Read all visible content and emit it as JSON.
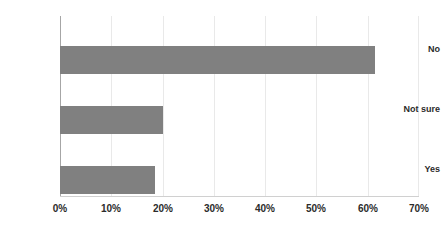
{
  "chart_data": {
    "type": "bar",
    "orientation": "horizontal",
    "title": "",
    "xlabel": "",
    "ylabel": "",
    "categories": [
      "No",
      "Not sure",
      "Yes"
    ],
    "values": [
      61.5,
      20.0,
      18.5
    ],
    "value_suffix": "%",
    "xlim": [
      0,
      70
    ],
    "xticks": [
      0,
      10,
      20,
      30,
      40,
      50,
      60,
      70
    ],
    "xtick_labels": [
      "0%",
      "10%",
      "20%",
      "30%",
      "40%",
      "50%",
      "60%",
      "70%"
    ],
    "grid": true,
    "grid_axis": "x",
    "legend": false,
    "legend_position": "none",
    "series": [
      {
        "name": "Share of respondents",
        "values": [
          61.5,
          20.0,
          18.5
        ]
      }
    ]
  },
  "style": {
    "bar_color": "#808080",
    "gridline_color": "#e9e9e9",
    "axis_color": "#a6a6a6",
    "baseline_color": "#d0d0d0",
    "label_color": "#2b2b2b",
    "background": "#ffffff"
  }
}
